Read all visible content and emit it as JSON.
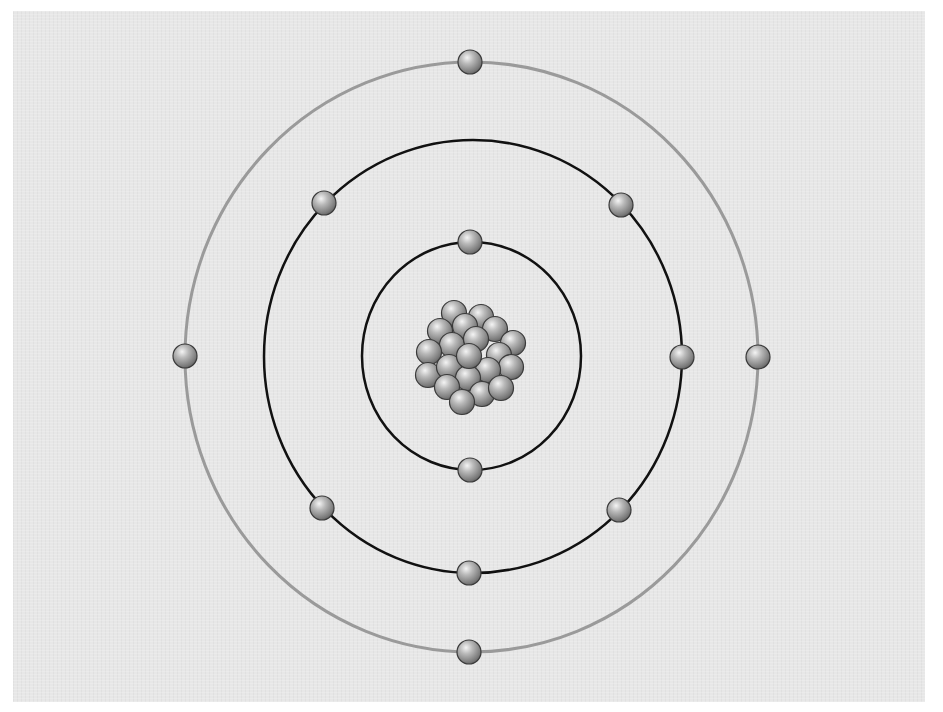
{
  "diagram": {
    "type": "bohr-atom-model",
    "colors": {
      "background_panel": "#e7e7e7",
      "page": "#ffffff",
      "inner_orbit": "#111111",
      "middle_orbit": "#111111",
      "outer_orbit": "#9a9a9a",
      "particle_light": "#f2f2f2",
      "particle_mid": "#a8a8a8",
      "particle_dark": "#5e5e5e",
      "particle_outline": "#3a3a3a"
    },
    "nucleus": {
      "center": [
        471,
        357
      ],
      "particle_count": 24,
      "particle_radius": 12
    },
    "shells": [
      {
        "name": "shell-1",
        "rx": 109,
        "ry": 114,
        "electron_count": 2,
        "stroke": "#111111"
      },
      {
        "name": "shell-2",
        "rx": 209,
        "ry": 216,
        "electron_count": 8,
        "stroke": "#111111"
      },
      {
        "name": "shell-3",
        "rx": 286,
        "ry": 295,
        "electron_count": 2,
        "stroke": "#9a9a9a"
      }
    ],
    "electron_configuration": [
      2,
      8,
      2
    ],
    "total_electrons": 12
  }
}
